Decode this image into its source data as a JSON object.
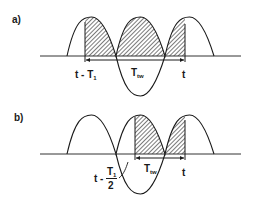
{
  "figure": {
    "panels": [
      {
        "id": "a",
        "label": "a)",
        "start_marker": {
          "text": "t - T",
          "subscript": "1"
        },
        "window_label": {
          "text": "T",
          "subscript": "tw"
        },
        "end_marker": {
          "text": "t"
        }
      },
      {
        "id": "b",
        "label": "b)",
        "start_marker": {
          "text": "t - ",
          "fraction_numerator": "T",
          "numerator_subscript": "1",
          "fraction_denominator": "2"
        },
        "window_label": {
          "text": "T",
          "subscript": "tw"
        },
        "end_marker": {
          "text": "t"
        }
      }
    ],
    "colors": {
      "ink": "#1a1a1a",
      "background": "#ffffff",
      "hatch": "#333333"
    }
  }
}
